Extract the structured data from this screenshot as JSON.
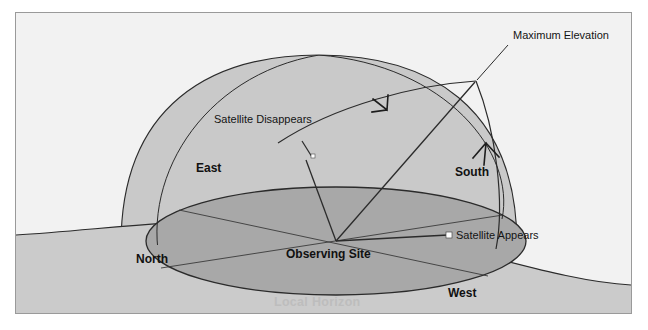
{
  "figure": {
    "title_visible": false,
    "background_color": "#f2f2f2",
    "frame_border_color": "#9a9a9a",
    "page_background": "#ffffff"
  },
  "colors": {
    "sky_dome_fill": "#c9c9c9",
    "ground_fill": "#cccccc",
    "horizon_plane_fill": "#a8a8a8",
    "outline_stroke": "#2b2b2b",
    "thin_stroke": "#3a3a3a",
    "marker_fill": "#ffffff",
    "label_text": "#141414",
    "horizon_label_text": "#bdbdbd"
  },
  "labels": {
    "maximum_elevation": "Maximum Elevation",
    "satellite_disappears": "Satellite Disappears",
    "satellite_appears": "Satellite Appears",
    "observing_site": "Observing Site",
    "local_horizon": "Local Horizon",
    "north": "North",
    "south": "South",
    "east": "East",
    "west": "West"
  },
  "markers": {
    "satellite_appears_point": {
      "x": 433,
      "y": 222,
      "shape": "square",
      "size": 6
    },
    "satellite_disappears_point": {
      "x": 297,
      "y": 143,
      "shape": "square",
      "size": 4
    },
    "maximum_elevation_point": {
      "x": 460,
      "y": 68
    },
    "observing_site_point": {
      "x": 320,
      "y": 228
    }
  },
  "caption": {
    "partial_text": ""
  }
}
